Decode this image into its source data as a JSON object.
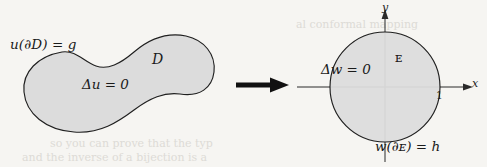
{
  "figure": {
    "background_color": "#f6f5f2",
    "ink_color": "#1a1a1a",
    "region_fill_color": "#dcdcdc"
  },
  "left_diagram": {
    "name": "general-domain",
    "shape": "blob",
    "labels": {
      "boundary_condition": "u(∂D) = g",
      "domain_name": "D",
      "pde": "Δu = 0"
    }
  },
  "transform_arrow": {
    "name": "maps-to-arrow",
    "glyph": "⟶",
    "direction": "right",
    "color": "#111111"
  },
  "right_diagram": {
    "name": "unit-disk-domain",
    "shape": "circle",
    "radius_label": "1",
    "axes": {
      "x_label": "x",
      "y_label": "y"
    },
    "labels": {
      "pde": "Δw = 0",
      "domain_name": "ᴇ",
      "boundary_condition": "w(∂ᴇ) = h"
    }
  },
  "artifacts": {
    "ghost_top_right": "al conformal mapping",
    "ghost_bottom_a": "so you can prove that the typ",
    "ghost_bottom_b": "and the inverse of a bijection is a"
  }
}
